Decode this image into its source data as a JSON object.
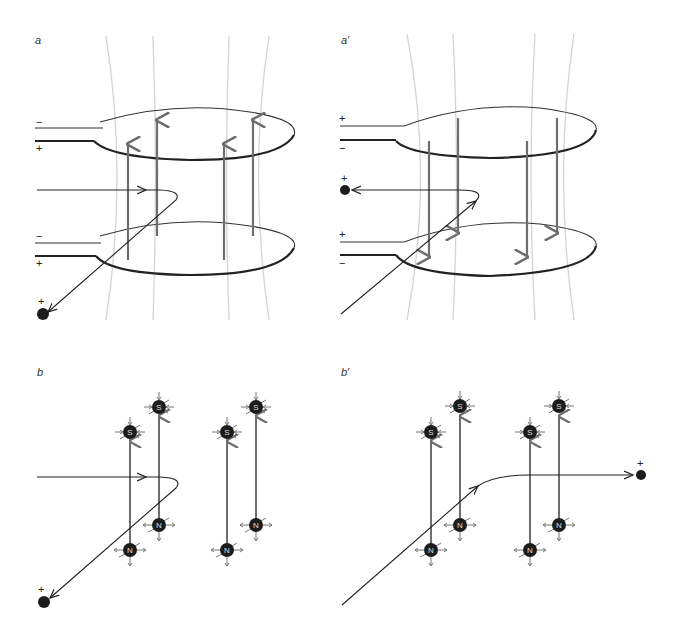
{
  "panels": {
    "a": {
      "label": "a",
      "lead_top_upper": "−",
      "lead_top_lower": "+",
      "lead_bottom_upper": "−",
      "lead_bottom_lower": "+",
      "charge": "+"
    },
    "a_prime": {
      "label": "a′",
      "lead_top_upper": "+",
      "lead_top_lower": "−",
      "lead_bottom_upper": "+",
      "lead_bottom_lower": "−",
      "charge": "+"
    },
    "b": {
      "label": "b",
      "charge": "+",
      "poles": [
        "S",
        "S",
        "S",
        "S",
        "N",
        "N",
        "N",
        "N"
      ]
    },
    "b_prime": {
      "label": "b′",
      "charge": "+",
      "poles": [
        "S",
        "S",
        "S",
        "S",
        "N",
        "N",
        "N",
        "N"
      ]
    }
  },
  "colors": {
    "field_line": "#d4d4d4",
    "flux_arrow": "#6e6e6e",
    "wire": "#222222",
    "pole": "#1c1c1c"
  }
}
